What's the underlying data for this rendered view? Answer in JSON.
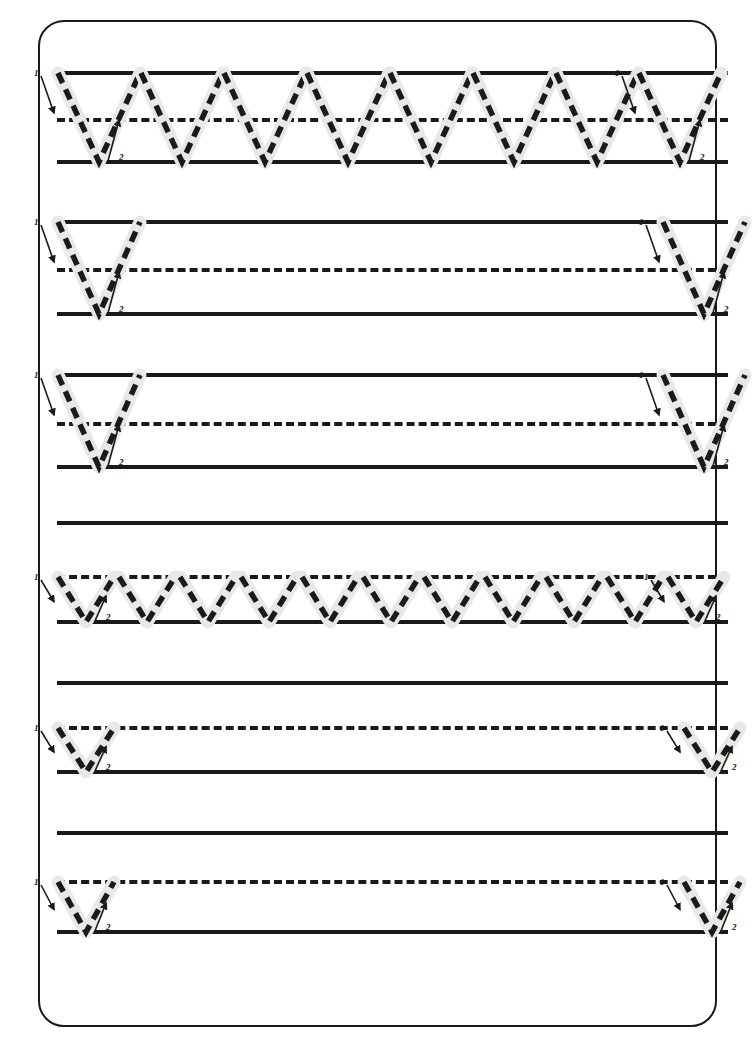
{
  "worksheet": {
    "type": "handwriting-tracing-worksheet",
    "letter_uppercase": "V",
    "letter_lowercase": "v",
    "stroke_count": 2,
    "stroke_labels": [
      "1",
      "2"
    ],
    "colors": {
      "ink": "#1a1a1a",
      "paper": "#ffffff",
      "highlight": "#e8e8e8",
      "trace_dash": "#1a1a1a"
    },
    "page_border": {
      "visible": true,
      "radius_px": 26,
      "stroke_px": 2.5
    }
  },
  "sections": [
    {
      "id": "section-1",
      "name": "uppercase-full-row",
      "case": "uppercase",
      "top_line_y": 73,
      "mid_line_y": 120,
      "base_line_y": 162,
      "mid_dashed": true,
      "letters_count": 8,
      "guided_indices": [
        0,
        7
      ],
      "letter_width": 82,
      "first_x": 58,
      "step": 83
    },
    {
      "id": "section-2",
      "name": "uppercase-practice-row-1",
      "case": "uppercase",
      "top_line_y": 222,
      "mid_line_y": 270,
      "base_line_y": 314,
      "mid_dashed": true,
      "letters_count": 2,
      "guided_indices": [
        0,
        1
      ],
      "letter_width": 82,
      "positions": [
        58,
        663
      ]
    },
    {
      "id": "section-3",
      "name": "uppercase-practice-row-2",
      "case": "uppercase",
      "top_line_y": 375,
      "mid_line_y": 424,
      "base_line_y": 467,
      "extra_line_y": 523,
      "mid_dashed": true,
      "letters_count": 2,
      "guided_indices": [
        0,
        1
      ],
      "letter_width": 82,
      "positions": [
        58,
        663
      ]
    },
    {
      "id": "section-4",
      "name": "lowercase-full-row",
      "case": "lowercase",
      "mid_line_y": 577,
      "base_line_y": 622,
      "extra_line_y": 683,
      "mid_dashed": true,
      "letters_count": 11,
      "guided_indices": [
        0,
        10
      ],
      "letter_width": 56,
      "first_x": 58,
      "step": 61
    },
    {
      "id": "section-5",
      "name": "lowercase-practice-row-1",
      "case": "lowercase",
      "mid_line_y": 728,
      "base_line_y": 772,
      "extra_line_y": 833,
      "mid_dashed": true,
      "letters_count": 2,
      "guided_indices": [
        0,
        1
      ],
      "letter_width": 56,
      "positions": [
        58,
        684
      ]
    },
    {
      "id": "section-6",
      "name": "lowercase-practice-row-2",
      "case": "lowercase",
      "mid_line_y": 882,
      "base_line_y": 932,
      "mid_dashed": true,
      "letters_count": 2,
      "guided_indices": [
        0,
        1
      ],
      "letter_width": 56,
      "positions": [
        58,
        684
      ]
    }
  ],
  "ruled_area": {
    "left_x": 57,
    "right_x": 728
  }
}
